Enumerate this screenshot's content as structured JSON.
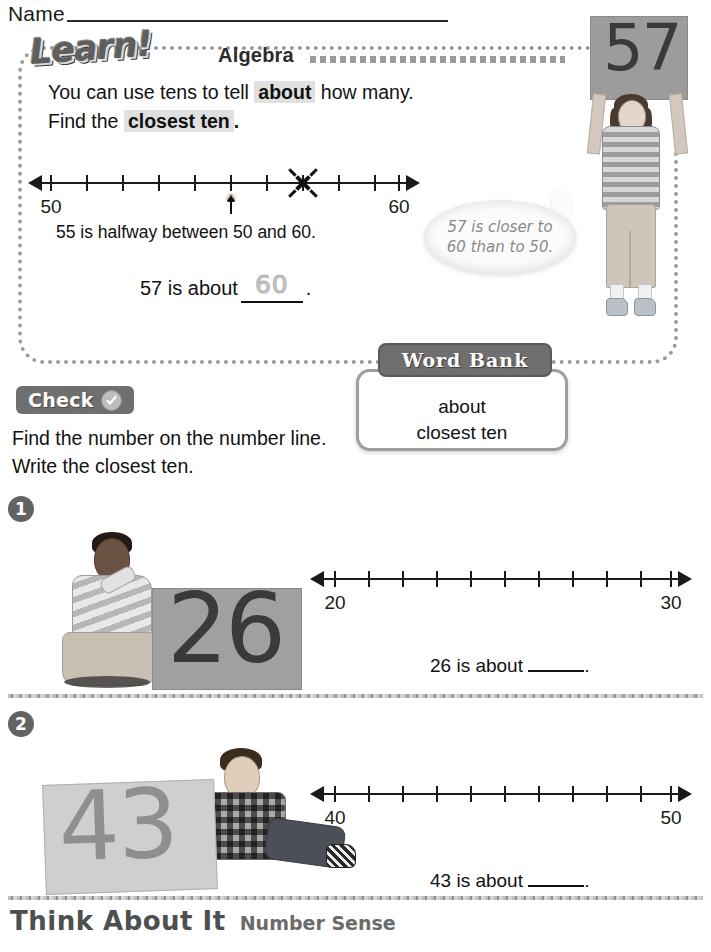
{
  "header": {
    "name_label": "Name"
  },
  "learn": {
    "logo": "Learn!",
    "logo_part_a": "Lea",
    "logo_part_b": "rn!",
    "subject": "Algebra",
    "line1_pre": "You can use tens to tell ",
    "line1_hl": "about",
    "line1_post": " how many.",
    "line2_pre": "Find the ",
    "line2_hl": "closest ten",
    "line2_post": ".",
    "numberline": {
      "start_label": "50",
      "end_label": "60",
      "ticks": 11,
      "marked_value": 57,
      "arrow_value": 55
    },
    "halfway_text": "55 is halfway between 50 and 60.",
    "answer_pre": "57 is about",
    "answer_value": "60",
    "answer_post": ".",
    "bubble_line1": "57 is closer to",
    "bubble_line2": "60 than to 50.",
    "photo_sign": "57"
  },
  "word_bank": {
    "title": "Word Bank",
    "items": [
      "about",
      "closest ten"
    ]
  },
  "check": {
    "label": "Check",
    "icon": "checkmark-circle-icon",
    "instruction_line1": "Find the number on the number line.",
    "instruction_line2": "Write the closest ten."
  },
  "exercises": [
    {
      "number": "1",
      "photo_sign": "26",
      "numberline": {
        "start_label": "20",
        "end_label": "30",
        "ticks": 11
      },
      "answer_pre": "26 is about",
      "answer_post": "."
    },
    {
      "number": "2",
      "photo_sign": "43",
      "numberline": {
        "start_label": "40",
        "end_label": "50",
        "ticks": 11
      },
      "answer_pre": "43 is about",
      "answer_post": "."
    }
  ],
  "footer": {
    "title": "Think About It",
    "subtitle": "Number Sense"
  },
  "colors": {
    "badge_gray": "#6f6f6f",
    "highlight_gray": "#e0e0e0",
    "rule_gray": "#9a9a9a",
    "ink": "#111111"
  }
}
